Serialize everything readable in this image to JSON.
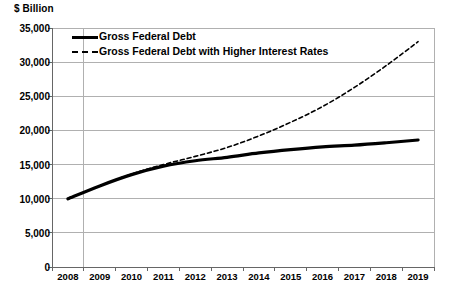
{
  "chart_data": {
    "type": "line",
    "title": "",
    "subtitle": "",
    "unit_label": "$ Billion",
    "xlabel": "",
    "ylabel": "$ Billion",
    "grid": true,
    "legend_position": "top-left-inside",
    "xlim": [
      2008,
      2019
    ],
    "ylim": [
      0,
      35000
    ],
    "ytick_step": 5000,
    "categories": [
      2008,
      2009,
      2010,
      2011,
      2012,
      2013,
      2014,
      2015,
      2016,
      2017,
      2018,
      2019
    ],
    "x_tick_labels": [
      "2008",
      "2009",
      "2010",
      "2011",
      "2012",
      "2013",
      "2014",
      "2015",
      "2016",
      "2017",
      "2018",
      "2019"
    ],
    "y_tick_labels": [
      "0",
      "5,000",
      "10,000",
      "15,000",
      "20,000",
      "25,000",
      "30,000",
      "35,000"
    ],
    "y_tick_values": [
      0,
      5000,
      10000,
      15000,
      20000,
      25000,
      30000,
      35000
    ],
    "series": [
      {
        "name": "Gross Federal Debt",
        "style": "solid",
        "color": "#000000",
        "width": 3.2,
        "values": [
          9986,
          11876,
          13529,
          14764,
          15560,
          16066,
          16700,
          17200,
          17600,
          17850,
          18200,
          18600
        ]
      },
      {
        "name": "Gross Federal Debt with Higher Interest Rates",
        "style": "dashed",
        "color": "#000000",
        "width": 1.6,
        "values": [
          9986,
          11876,
          13620,
          15000,
          16200,
          17500,
          19200,
          21200,
          23500,
          26300,
          29500,
          33000
        ]
      }
    ],
    "annotations": []
  },
  "legend": {
    "items": [
      {
        "label": "Gross Federal Debt",
        "style": "solid"
      },
      {
        "label": "Gross Federal Debt with Higher Interest Rates",
        "style": "dashed"
      }
    ]
  },
  "colors": {
    "plot_background": "#ffffff",
    "gridline": "#b0b0b0",
    "axis": "#666666",
    "series_line": "#000000",
    "text": "#000000"
  }
}
